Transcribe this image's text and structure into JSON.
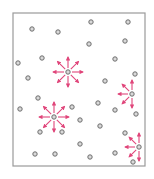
{
  "diagram": {
    "type": "particle-box",
    "frame": {
      "x": 13,
      "y": 13,
      "width": 132,
      "height": 153,
      "stroke": "#9a9a9a"
    },
    "colors": {
      "particle_stroke": "#6e6e6e",
      "particle_fill": "#d9d9d9",
      "arrow": "#e0457a",
      "background": "#ffffff"
    },
    "particles": [
      {
        "x": 32,
        "y": 29
      },
      {
        "x": 58,
        "y": 32
      },
      {
        "x": 91,
        "y": 22
      },
      {
        "x": 128,
        "y": 22
      },
      {
        "x": 89,
        "y": 44
      },
      {
        "x": 125,
        "y": 41
      },
      {
        "x": 42,
        "y": 58
      },
      {
        "x": 115,
        "y": 59
      },
      {
        "x": 18,
        "y": 63
      },
      {
        "x": 28,
        "y": 78
      },
      {
        "x": 105,
        "y": 81
      },
      {
        "x": 135,
        "y": 74
      },
      {
        "x": 38,
        "y": 98
      },
      {
        "x": 20,
        "y": 109
      },
      {
        "x": 72,
        "y": 107
      },
      {
        "x": 98,
        "y": 103
      },
      {
        "x": 115,
        "y": 110
      },
      {
        "x": 136,
        "y": 114
      },
      {
        "x": 80,
        "y": 120
      },
      {
        "x": 100,
        "y": 126
      },
      {
        "x": 40,
        "y": 132
      },
      {
        "x": 62,
        "y": 132
      },
      {
        "x": 125,
        "y": 133
      },
      {
        "x": 80,
        "y": 144
      },
      {
        "x": 35,
        "y": 154
      },
      {
        "x": 55,
        "y": 154
      },
      {
        "x": 90,
        "y": 157
      },
      {
        "x": 115,
        "y": 153
      },
      {
        "x": 133,
        "y": 162
      }
    ],
    "bursts": [
      {
        "x": 68,
        "y": 72,
        "length": 15,
        "directions": [
          0,
          45,
          90,
          135,
          180,
          225,
          270,
          315
        ]
      },
      {
        "x": 54,
        "y": 117,
        "length": 15,
        "directions": [
          0,
          45,
          90,
          135,
          180,
          225,
          270,
          315
        ]
      },
      {
        "x": 132,
        "y": 94,
        "length": 14,
        "directions": [
          90,
          135,
          180,
          225,
          270
        ]
      },
      {
        "x": 139,
        "y": 147,
        "length": 14,
        "directions": [
          90,
          135,
          180,
          225,
          270
        ]
      }
    ]
  }
}
